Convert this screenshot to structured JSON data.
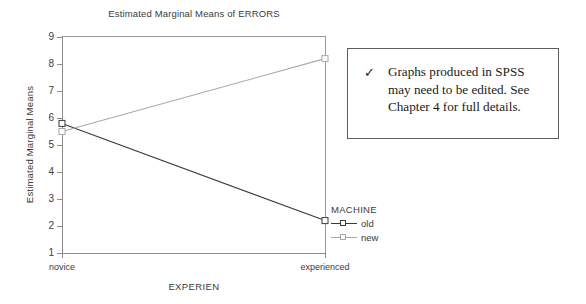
{
  "chart_data": {
    "type": "line",
    "title": "Estimated Marginal Means of ERRORS",
    "xlabel": "EXPERIEN",
    "ylabel": "Estimated Marginal Means",
    "categories": [
      "novice",
      "experienced"
    ],
    "ylim": [
      1,
      9
    ],
    "yticks": [
      9,
      8,
      7,
      6,
      5,
      4,
      3,
      2,
      1
    ],
    "grid": false,
    "legend_position": "right-bottom-outside",
    "legend_title": "MACHINE",
    "series": [
      {
        "name": "old",
        "values": [
          5.8,
          2.2
        ],
        "color": "#3a3a3a"
      },
      {
        "name": "new",
        "values": [
          5.5,
          8.2
        ],
        "color": "#a8a8a8"
      }
    ]
  },
  "legend": {
    "title": "MACHINE",
    "entries": [
      {
        "label": "old",
        "color": "#3a3a3a"
      },
      {
        "label": "new",
        "color": "#a8a8a8"
      }
    ]
  },
  "callout": {
    "check_icon": "check-icon",
    "text": "Graphs produced in SPSS may need to be edited. See Chapter 4 for full details."
  }
}
